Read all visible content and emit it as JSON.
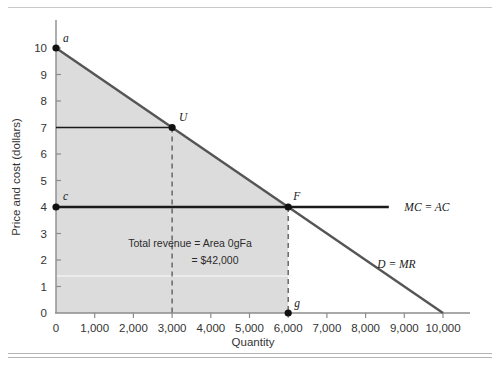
{
  "figure": {
    "axis_title_y": "Price and cost (dollars)",
    "axis_title_x": "Quantity",
    "annotation_line1": "Total revenue = Area 0gFa",
    "annotation_line2": "= $42,000",
    "colors": {
      "shade": "#dcdcdc",
      "demand_line": "#555555",
      "cost_line": "#1a1a1a",
      "axis": "#8c8c8c",
      "text": "#2b2b2b"
    }
  },
  "chart_data": {
    "type": "line",
    "title": "",
    "xlabel": "Quantity",
    "ylabel": "Price and cost (dollars)",
    "xlim": [
      0,
      10800
    ],
    "ylim": [
      0,
      10.6
    ],
    "grid": false,
    "legend": "inline-curve-labels",
    "x_ticks": [
      0,
      1000,
      2000,
      3000,
      4000,
      5000,
      6000,
      7000,
      8000,
      9000,
      10000
    ],
    "x_tick_labels": [
      "0",
      "1,000",
      "2,000",
      "3,000",
      "4,000",
      "5,000",
      "6,000",
      "7,000",
      "8,000",
      "9,000",
      "10,000"
    ],
    "y_ticks": [
      0,
      1,
      2,
      3,
      4,
      5,
      6,
      7,
      8,
      9,
      10
    ],
    "y_tick_labels": [
      "0",
      "1",
      "2",
      "3",
      "4",
      "5",
      "6",
      "7",
      "8",
      "9",
      "10"
    ],
    "series": [
      {
        "name": "D = MR",
        "label": "D = MR",
        "type": "line",
        "x": [
          0,
          10000
        ],
        "values": [
          10,
          0
        ],
        "color": "#555555",
        "label_x": 8300,
        "label_y": 1.85
      },
      {
        "name": "MC = AC",
        "label": "MC = AC",
        "type": "line",
        "x": [
          0,
          8600
        ],
        "values": [
          4,
          4
        ],
        "color": "#1a1a1a",
        "label_x": 9000,
        "label_y": 4.0
      }
    ],
    "points": [
      {
        "label": "a",
        "x": 0,
        "y": 10,
        "label_dx": 7,
        "label_dy": -6
      },
      {
        "label": "U",
        "x": 3000,
        "y": 7,
        "label_dx": 7,
        "label_dy": -7
      },
      {
        "label": "c",
        "x": 0,
        "y": 4,
        "label_dx": 7,
        "label_dy": -7
      },
      {
        "label": "F",
        "x": 6000,
        "y": 4,
        "label_dx": 5,
        "label_dy": -7
      },
      {
        "label": "g",
        "x": 6000,
        "y": 0,
        "label_dx": 6,
        "label_dy": -6
      }
    ],
    "guides": [
      {
        "name": "price-guide-U",
        "style": "solid",
        "from": [
          0,
          7
        ],
        "to": [
          3000,
          7
        ]
      },
      {
        "name": "quantity-guide-U",
        "style": "dashed",
        "from": [
          3000,
          7
        ],
        "to": [
          3000,
          0
        ]
      },
      {
        "name": "quantity-guide-F",
        "style": "dashed",
        "from": [
          6000,
          4
        ],
        "to": [
          6000,
          0
        ]
      }
    ],
    "shaded_region": {
      "name": "total-revenue-area",
      "vertices_label": "0gFa",
      "value": 42000,
      "value_label": "$42,000",
      "polygon": [
        [
          0,
          0
        ],
        [
          6000,
          0
        ],
        [
          6000,
          4
        ],
        [
          0,
          10
        ]
      ]
    }
  }
}
